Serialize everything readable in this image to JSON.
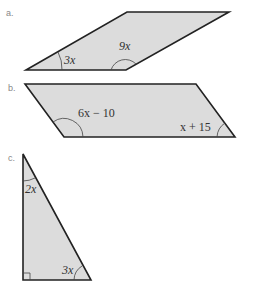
{
  "figures": [
    {
      "label": "a.",
      "shape": "parallelogram",
      "angles": [
        {
          "expr_var": "3x",
          "position": "bottom-left acute angle"
        },
        {
          "expr_var": "9x",
          "position": "bottom-right obtuse angle"
        }
      ],
      "angle_labels": {
        "left": "3x",
        "right": "9x"
      }
    },
    {
      "label": "b.",
      "shape": "parallelogram",
      "angle_labels": {
        "left": "6x − 10",
        "right": "x + 15"
      }
    },
    {
      "label": "c.",
      "shape": "right triangle",
      "angle_labels": {
        "top": "2x",
        "bottom_right": "3x"
      },
      "right_angle": "bottom-left"
    }
  ],
  "colors": {
    "fill": "#dcdcdc",
    "stroke": "#222222"
  }
}
